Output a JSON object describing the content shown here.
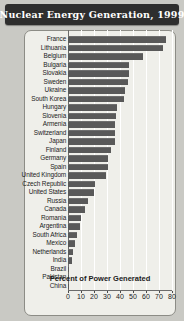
{
  "chart_data": {
    "type": "bar",
    "orientation": "horizontal",
    "title": "Nuclear Energy Generation, 1999",
    "xlabel": "Percent of Power Generated",
    "ylabel": "",
    "xlim": [
      0,
      80
    ],
    "xticks": [
      0,
      10,
      20,
      30,
      40,
      50,
      60,
      70,
      80
    ],
    "grid": true,
    "legend": null,
    "categories": [
      "France",
      "Lithuania",
      "Belgium",
      "Bulgaria",
      "Slovakia",
      "Sweden",
      "Ukraine",
      "South Korea",
      "Hungary",
      "Slovenia",
      "Armenia",
      "Switzerland",
      "Japan",
      "Finland",
      "Germany",
      "Spain",
      "United Kingdom",
      "Czech Republic",
      "United States",
      "Russia",
      "Canada",
      "Romania",
      "Argentina",
      "South Africa",
      "Mexico",
      "Netherlands",
      "India",
      "Brazil",
      "Pakistan",
      "China"
    ],
    "values": [
      75,
      73,
      58,
      47,
      47,
      46,
      44,
      43,
      38,
      37,
      36,
      36,
      36,
      33,
      31,
      31,
      29,
      21,
      20,
      15,
      13,
      10,
      9,
      7,
      5,
      4,
      3,
      1,
      1,
      1
    ],
    "bar_color": "#595959"
  },
  "colors": {
    "page_background": "#c9c9c4",
    "title_bar": "#2e2e2e",
    "title_text": "#ffffff",
    "card_background": "#efefea",
    "card_border": "#8c8c86",
    "bar": "#595959",
    "gridline": "#ffffff",
    "axis": "#6b6b6b",
    "label_text": "#1b1b1b"
  }
}
